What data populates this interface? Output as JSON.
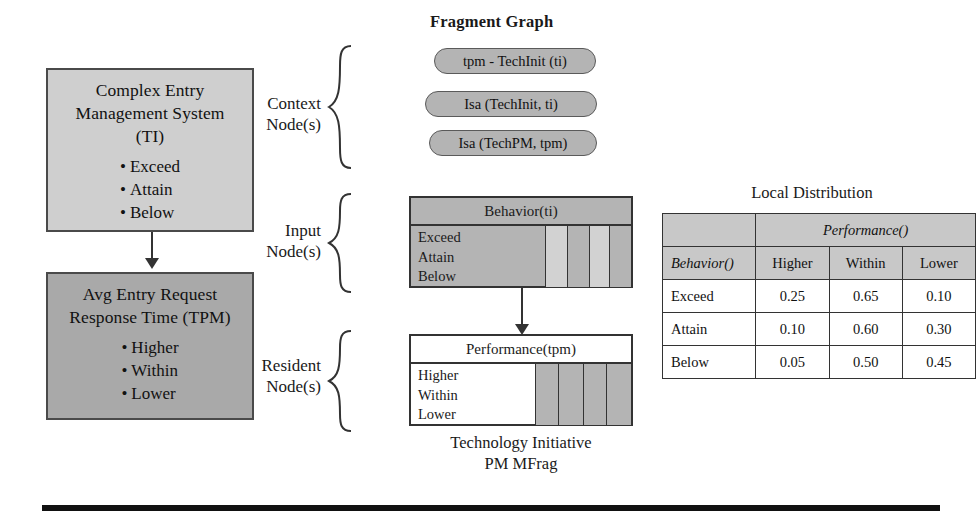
{
  "left_column": {
    "entity_top": {
      "title_lines": [
        "Complex Entry",
        "Management System",
        "(TI)"
      ],
      "states": [
        "Exceed",
        "Attain",
        "Below"
      ],
      "fill": "#cfcfcf"
    },
    "entity_bottom": {
      "title_lines": [
        "Avg Entry Request",
        "Response Time (TPM)"
      ],
      "states": [
        "Higher",
        "Within",
        "Lower"
      ],
      "fill": "#a9a9a9"
    },
    "connector": "down-arrow"
  },
  "fragment_graph": {
    "title": "Fragment Graph",
    "context": {
      "label_lines": [
        "Context",
        "Node(s)"
      ],
      "pills": [
        "tpm - TechInit (ti)",
        "Isa (TechInit, ti)",
        "Isa (TechPM, tpm)"
      ]
    },
    "input": {
      "label_lines": [
        "Input",
        "Node(s)"
      ],
      "node": {
        "header": "Behavior(ti)",
        "states": [
          "Exceed",
          "Attain",
          "Below"
        ],
        "fill": "#b4b4b4"
      }
    },
    "resident": {
      "label_lines": [
        "Resident",
        "Node(s)"
      ],
      "node": {
        "header": "Performance(tpm)",
        "states": [
          "Higher",
          "Within",
          "Lower"
        ],
        "fill": "#ffffff"
      }
    },
    "caption_lines": [
      "Technology Initiative",
      "PM MFrag"
    ]
  },
  "local_distribution": {
    "title": "Local Distribution",
    "group_header": "Performance()",
    "row_header": "Behavior()",
    "columns": [
      "Higher",
      "Within",
      "Lower"
    ],
    "rows": [
      {
        "label": "Exceed",
        "values": [
          "0.25",
          "0.65",
          "0.10"
        ]
      },
      {
        "label": "Attain",
        "values": [
          "0.10",
          "0.60",
          "0.30"
        ]
      },
      {
        "label": "Below",
        "values": [
          "0.05",
          "0.50",
          "0.45"
        ]
      }
    ]
  },
  "footer": {
    "rule": "horizontal-rule"
  }
}
